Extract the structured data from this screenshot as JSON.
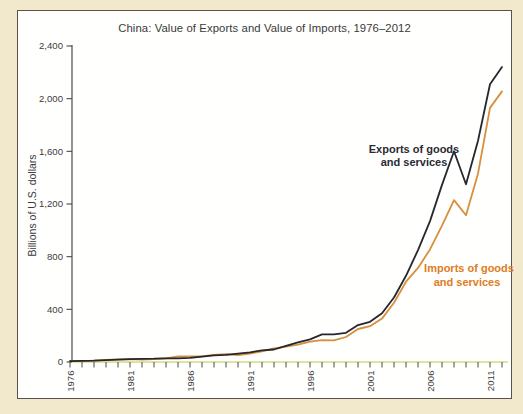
{
  "title": "China: Value of Exports and Value of Imports, 1976–2012",
  "chart_data": {
    "type": "line",
    "title": "China: Value of Exports and Value of Imports, 1976–2012",
    "xlabel": "",
    "ylabel": "Billions of U.S. dollars",
    "ylim": [
      0,
      2400
    ],
    "xlim": [
      1976,
      2012
    ],
    "grid": false,
    "legend_position": "in-plot annotations next to lines",
    "x": [
      1976,
      1977,
      1978,
      1979,
      1980,
      1981,
      1982,
      1983,
      1984,
      1985,
      1986,
      1987,
      1988,
      1989,
      1990,
      1991,
      1992,
      1993,
      1994,
      1995,
      1996,
      1997,
      1998,
      1999,
      2000,
      2001,
      2002,
      2003,
      2004,
      2005,
      2006,
      2007,
      2008,
      2009,
      2010,
      2011,
      2012
    ],
    "series": [
      {
        "name": "Exports of goods and services",
        "color": "#26262e",
        "values": [
          7,
          8,
          10,
          14,
          18,
          22,
          24,
          25,
          28,
          28,
          32,
          41,
          50,
          55,
          64,
          74,
          88,
          95,
          122,
          150,
          172,
          210,
          210,
          222,
          280,
          305,
          370,
          490,
          655,
          850,
          1070,
          1345,
          1600,
          1350,
          1680,
          2110,
          2240
        ]
      },
      {
        "name": "Imports of goods and services",
        "color": "#d78f3d",
        "values": [
          7,
          7,
          11,
          16,
          20,
          22,
          19,
          21,
          27,
          42,
          43,
          43,
          55,
          59,
          53,
          64,
          81,
          104,
          116,
          132,
          154,
          166,
          164,
          190,
          251,
          272,
          330,
          450,
          610,
          715,
          855,
          1035,
          1230,
          1115,
          1430,
          1930,
          2055
        ]
      }
    ],
    "y_ticks": [
      0,
      400,
      800,
      1200,
      1600,
      2000,
      2400
    ],
    "y_tick_labels": [
      "0",
      "400",
      "800",
      "1,200",
      "1,600",
      "2,000",
      "2,400"
    ],
    "x_tick_years": [
      1976,
      1981,
      1986,
      1991,
      1996,
      2001,
      2006,
      2011
    ],
    "x_tick_labels": [
      "1976",
      "1981",
      "1986",
      "1991",
      "1996",
      "2001",
      "2006",
      "2011"
    ]
  },
  "annotations": {
    "exports_label": {
      "line1": "Exports of goods",
      "line2": "and services"
    },
    "imports_label": {
      "line1": "Imports of goods",
      "line2": "and services"
    }
  },
  "colors": {
    "background": "#f2e8cb",
    "panel": "#fffffe",
    "panel_border": "#57534b",
    "axis_text": "#3b3b3b",
    "exports_line": "#26262e",
    "imports_line": "#d78f3d",
    "imports_label": "#e07c1e",
    "zero_baseline": "#dde4a2"
  }
}
